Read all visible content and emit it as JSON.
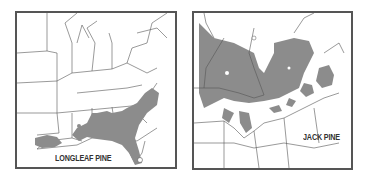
{
  "maps": [
    {
      "title": "LONGLEAF PINE",
      "region": "Southeastern United States",
      "range_color": "#8c8c8c",
      "border_color": "#555555"
    },
    {
      "title": "JACK PINE",
      "region": "Northeastern United States and Canada",
      "range_color": "#8c8c8c",
      "border_color": "#555555"
    }
  ],
  "colors": {
    "background": "#ffffff",
    "range_fill": "#8c8c8c",
    "lines": "#444444"
  }
}
